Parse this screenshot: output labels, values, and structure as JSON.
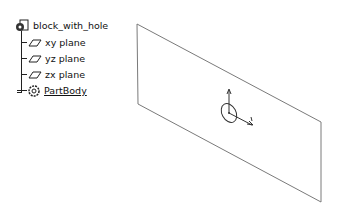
{
  "tree": {
    "root": {
      "label": "block_with_hole",
      "icon": "part-document-icon"
    },
    "children": [
      {
        "label": "xy plane",
        "icon": "plane-icon"
      },
      {
        "label": "yz plane",
        "icon": "plane-icon"
      },
      {
        "label": "zx plane",
        "icon": "plane-icon"
      },
      {
        "label": "PartBody",
        "icon": "body-gear-icon"
      }
    ]
  },
  "viewport": {
    "plane_color": "#7a7a7a",
    "axis_labels": {
      "v": "V",
      "h": "H"
    }
  }
}
